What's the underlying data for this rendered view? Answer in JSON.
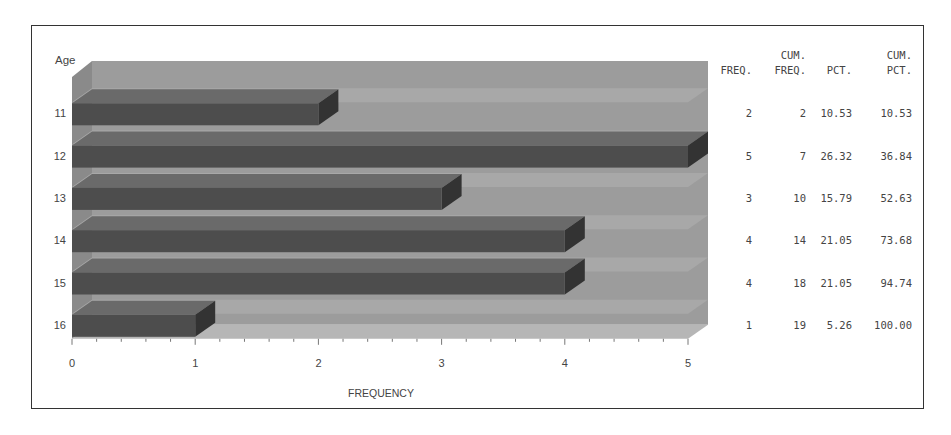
{
  "chart_data": {
    "type": "bar",
    "orientation": "horizontal",
    "style": "3d",
    "title": "",
    "ylabel": "Age",
    "xlabel": "FREQUENCY",
    "categories": [
      "11",
      "12",
      "13",
      "14",
      "15",
      "16"
    ],
    "values": [
      2,
      5,
      3,
      4,
      4,
      1
    ],
    "xlim": [
      0,
      5
    ],
    "xticks": [
      "0",
      "1",
      "2",
      "3",
      "4",
      "5"
    ],
    "grid": false,
    "legend": null,
    "table": {
      "columns": [
        {
          "header_top": "",
          "header_bottom": "FREQ."
        },
        {
          "header_top": "CUM.",
          "header_bottom": "FREQ."
        },
        {
          "header_top": "",
          "header_bottom": "PCT."
        },
        {
          "header_top": "CUM.",
          "header_bottom": "PCT."
        }
      ],
      "rows": [
        {
          "freq": "2",
          "cum_freq": "2",
          "pct": "10.53",
          "cum_pct": "10.53"
        },
        {
          "freq": "5",
          "cum_freq": "7",
          "pct": "26.32",
          "cum_pct": "36.84"
        },
        {
          "freq": "3",
          "cum_freq": "10",
          "pct": "15.79",
          "cum_pct": "52.63"
        },
        {
          "freq": "4",
          "cum_freq": "14",
          "pct": "21.05",
          "cum_pct": "73.68"
        },
        {
          "freq": "4",
          "cum_freq": "18",
          "pct": "21.05",
          "cum_pct": "94.74"
        },
        {
          "freq": "1",
          "cum_freq": "19",
          "pct": "5.26",
          "cum_pct": "100.00"
        }
      ]
    }
  },
  "colors": {
    "bar_front": "#4d4d4d",
    "bar_top": "#6a6a6a",
    "bar_side": "#333333",
    "wall": "#9c9c9c",
    "wall_shadow": "#8a8a8a",
    "floor": "#b6b6b6",
    "border": "#333333",
    "text": "#444444"
  }
}
